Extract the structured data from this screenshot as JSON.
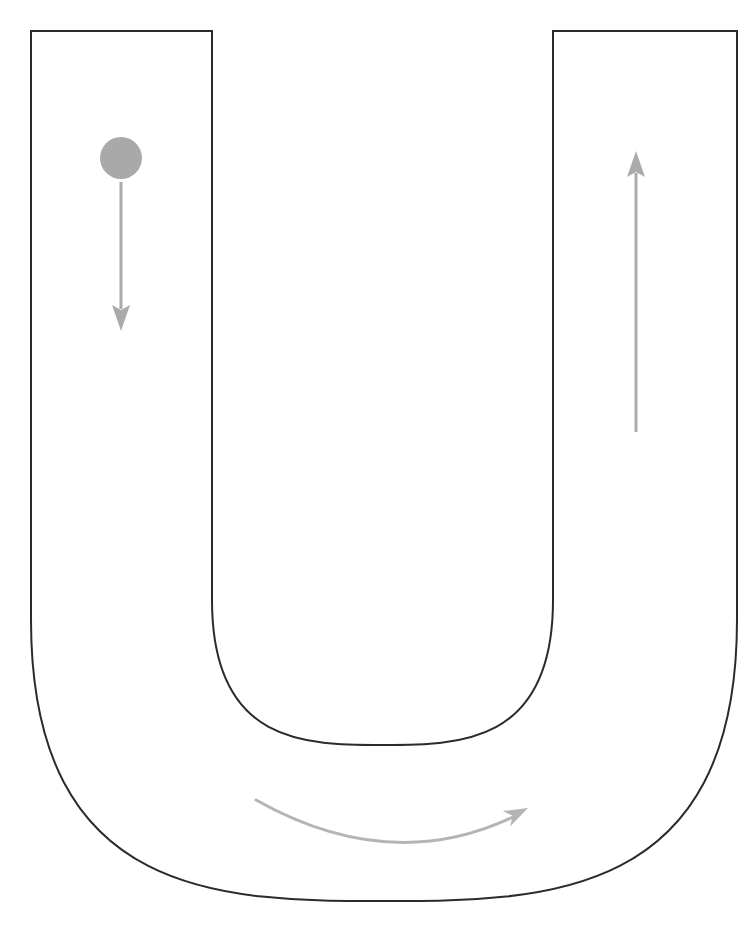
{
  "canvas": {
    "width": 748,
    "height": 935,
    "background": "#ffffff"
  },
  "figure": {
    "name": "u-tube-with-falling-ball"
  },
  "colors": {
    "outline": "#2b2b2b",
    "ball": "#a9a9a9",
    "arrow": "#ababab",
    "curved_arrow": "#b4b4b4",
    "background": "#ffffff"
  },
  "geometry": {
    "outline_stroke_width": 2,
    "left_arm": {
      "outer_x": 31,
      "inner_x": 212,
      "top_y": 31
    },
    "right_arm": {
      "inner_x": 553,
      "outer_x": 737,
      "top_y": 31
    },
    "bend": {
      "outer_bottom_y": 901,
      "inner_bottom_y": 745,
      "outer_straight_end_y": 620,
      "inner_straight_end_y": 600
    }
  },
  "ball": {
    "label": "ball",
    "center_x": 121,
    "center_y": 158,
    "radius": 21,
    "color": "#a9a9a9"
  },
  "arrows": {
    "down": {
      "label": "downward-motion-arrow",
      "x": 121,
      "start_y": 182,
      "end_y": 331,
      "direction": "down",
      "color": "#ababab",
      "shaft_width": 3,
      "head_width": 18,
      "head_length": 26
    },
    "up": {
      "label": "upward-motion-arrow",
      "x": 636,
      "start_y": 432,
      "end_y": 151,
      "direction": "up",
      "color": "#ababab",
      "shaft_width": 3,
      "head_width": 18,
      "head_length": 26
    },
    "curved": {
      "label": "bend-flow-arrow",
      "start_x": 256,
      "start_y": 800,
      "control_x": 391,
      "control_y": 876,
      "end_x": 528,
      "end_y": 808,
      "direction": "clockwise-right",
      "color": "#b4b4b4",
      "stroke_width": 3,
      "head_width": 17,
      "head_length": 24
    }
  }
}
